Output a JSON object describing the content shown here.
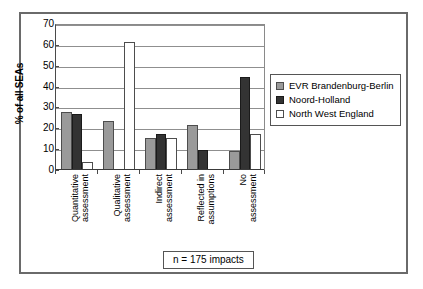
{
  "chart_data": {
    "type": "bar",
    "title": "",
    "subtitle": "",
    "xlabel": "",
    "ylabel": "% of all SEAs",
    "ylim": [
      0,
      70
    ],
    "ytick_values": [
      70,
      60,
      50,
      40,
      30,
      20,
      10,
      0
    ],
    "ytick_labels": [
      "70",
      "60",
      "50",
      "40",
      "30",
      "20",
      "10",
      "0"
    ],
    "grid": true,
    "grid_axis": "y",
    "legend_position": "right",
    "categories": [
      "Quantitative assessment",
      "Qualitative assessment",
      "Indirect assessment",
      "Reflected in assumptions",
      "No assessment"
    ],
    "category_lines": [
      [
        "Quantitative",
        "assessment"
      ],
      [
        "Qualitative",
        "assessment"
      ],
      [
        "Indirect",
        "assessment"
      ],
      [
        "Reflected in",
        "assumptions"
      ],
      [
        "No",
        "assessment"
      ]
    ],
    "series": [
      {
        "name": "EVR Brandenburg-Berlin",
        "color": "#9a9a9a",
        "values": [
          28,
          23.5,
          15.5,
          21.5,
          9
        ]
      },
      {
        "name": "Noord-Holland",
        "color": "#333333",
        "values": [
          27,
          0,
          17.5,
          9.5,
          44.5
        ]
      },
      {
        "name": "North West England",
        "color": "#ffffff",
        "values": [
          4,
          61.5,
          15.5,
          0,
          17.5
        ]
      }
    ],
    "annotations": [
      {
        "name": "sample-size",
        "text": "n = 175 impacts"
      }
    ]
  },
  "legend": {
    "entries": [
      {
        "label": "EVR Brandenburg-Berlin"
      },
      {
        "label": "Noord-Holland"
      },
      {
        "label": "North West England"
      }
    ]
  },
  "footnote": {
    "text": "n = 175 impacts"
  }
}
